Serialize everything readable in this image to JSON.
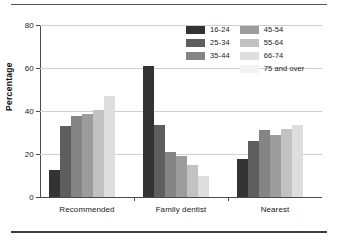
{
  "chart_data": {
    "type": "bar",
    "title": "",
    "subtitle": "",
    "xlabel": "",
    "ylabel": "Percentage",
    "ylim": [
      0,
      80
    ],
    "yticks": [
      0,
      20,
      40,
      60,
      80
    ],
    "ytick_labels": [
      "0",
      "20",
      "40",
      "60",
      "80"
    ],
    "grid": "horizontal",
    "legend_position": "top-right",
    "categories": [
      "Recommended",
      "Family dentist",
      "Nearest"
    ],
    "series": [
      {
        "name": "16-24",
        "color": "#333333",
        "values": [
          12.5,
          61.0,
          17.5
        ]
      },
      {
        "name": "25-34",
        "color": "#5e5e5e",
        "values": [
          33.0,
          33.5,
          26.0
        ]
      },
      {
        "name": "35-44",
        "color": "#848484",
        "values": [
          37.5,
          21.0,
          31.0
        ]
      },
      {
        "name": "45-54",
        "color": "#9c9c9c",
        "values": [
          38.5,
          19.0,
          29.0
        ]
      },
      {
        "name": "55-64",
        "color": "#c2c2c2",
        "values": [
          40.5,
          15.0,
          31.5
        ]
      },
      {
        "name": "66-74",
        "color": "#dedede",
        "values": [
          47.0,
          10.0,
          33.5
        ]
      },
      {
        "name": "75 and over",
        "color": "#f2f2f2",
        "values": [
          0,
          0,
          0
        ]
      }
    ]
  },
  "legend": {
    "column_left": [
      "16-24",
      "25-34",
      "35-44"
    ],
    "column_right": [
      "45-54",
      "55-64",
      "66-74",
      "75 and over"
    ]
  },
  "axes": {
    "y_label": "Percentage",
    "y_tick_0": "0",
    "y_tick_1": "20",
    "y_tick_2": "40",
    "y_tick_3": "60",
    "y_tick_4": "80"
  },
  "x_categories": {
    "cat_0": "Recommended",
    "cat_1": "Family dentist",
    "cat_2": "Nearest"
  }
}
